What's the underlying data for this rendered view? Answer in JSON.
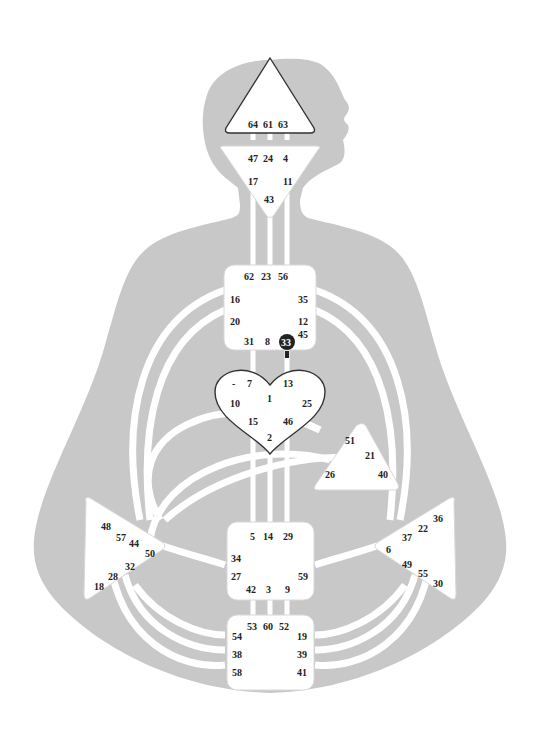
{
  "colors": {
    "body": "#c8c8c8",
    "center_fill": "#ffffff",
    "defined_outline": "#333333",
    "activated_gate": "#222222",
    "text": "#222222"
  },
  "centers": {
    "head": {
      "shape": "triangle-up",
      "defined": true,
      "gates": [
        "64",
        "61",
        "63"
      ]
    },
    "ajna": {
      "shape": "triangle-down",
      "defined": false,
      "gates": [
        "47",
        "24",
        "4",
        "17",
        "11",
        "43"
      ]
    },
    "throat": {
      "shape": "square",
      "defined": false,
      "gates": [
        "62",
        "23",
        "56",
        "16",
        "35",
        "20",
        "12",
        "31",
        "8",
        "33",
        "45"
      ]
    },
    "g": {
      "shape": "heart",
      "defined": true,
      "gates": [
        "-",
        "7",
        "13",
        "1",
        "10",
        "25",
        "15",
        "46",
        "2"
      ]
    },
    "ego": {
      "shape": "triangle",
      "defined": false,
      "gates": [
        "51",
        "21",
        "26",
        "40"
      ]
    },
    "sacral": {
      "shape": "square",
      "defined": false,
      "gates": [
        "5",
        "14",
        "29",
        "34",
        "27",
        "59",
        "42",
        "3",
        "9"
      ]
    },
    "spleen": {
      "shape": "triangle-right",
      "defined": false,
      "gates": [
        "48",
        "57",
        "44",
        "50",
        "32",
        "28",
        "18"
      ]
    },
    "solar_plexus": {
      "shape": "triangle-left",
      "defined": false,
      "gates": [
        "36",
        "22",
        "37",
        "6",
        "49",
        "55",
        "30"
      ]
    },
    "root": {
      "shape": "square",
      "defined": false,
      "gates": [
        "53",
        "60",
        "52",
        "54",
        "19",
        "38",
        "39",
        "58",
        "41"
      ]
    }
  },
  "activated_gates": [
    "33"
  ]
}
